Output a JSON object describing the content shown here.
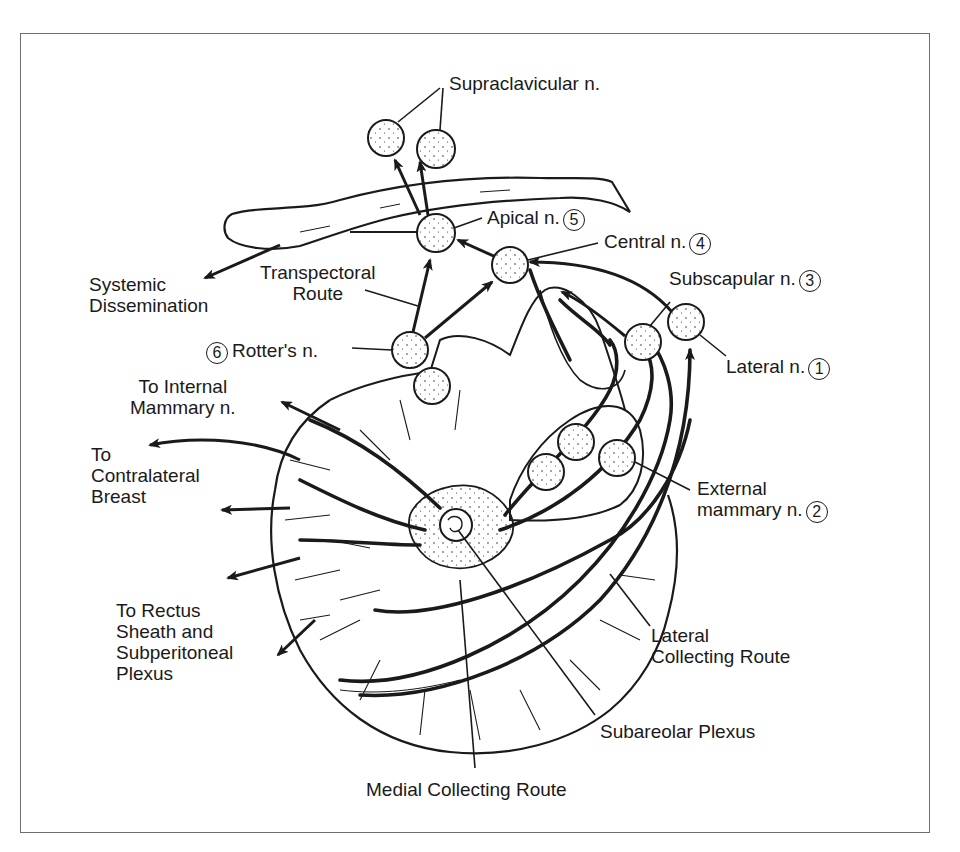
{
  "diagram": {
    "colors": {
      "line": "#1a1a1a",
      "frame": "#6e6e6e",
      "background": "#ffffff"
    },
    "node_labels": {
      "supraclavicular": "Supraclavicular n.",
      "apical": {
        "text": "Apical n.",
        "number": "5"
      },
      "central": {
        "text": "Central n.",
        "number": "4"
      },
      "subscapular": {
        "text": "Subscapular n.",
        "number": "3"
      },
      "lateral": {
        "text": "Lateral n.",
        "number": "1"
      },
      "external_mammary": {
        "line1": "External",
        "line2": "mammary n.",
        "number": "2"
      },
      "rotters": {
        "text": "Rotter's n.",
        "number": "6"
      }
    },
    "route_labels": {
      "systemic": {
        "line1": "Systemic",
        "line2": "Dissemination"
      },
      "transpectoral": {
        "line1": "Transpectoral",
        "line2": "Route"
      },
      "internal_mammary": {
        "line1": "To Internal",
        "line2": "Mammary n."
      },
      "contralateral": {
        "line1": "To",
        "line2": "Contralateral",
        "line3": "Breast"
      },
      "rectus": {
        "line1": "To Rectus",
        "line2": "Sheath and",
        "line3": "Subperitoneal",
        "line4": "Plexus"
      },
      "lateral_collecting": {
        "line1": "Lateral",
        "line2": "Collecting Route"
      },
      "subareolar": "Subareolar Plexus",
      "medial_collecting": "Medial Collecting Route"
    }
  }
}
